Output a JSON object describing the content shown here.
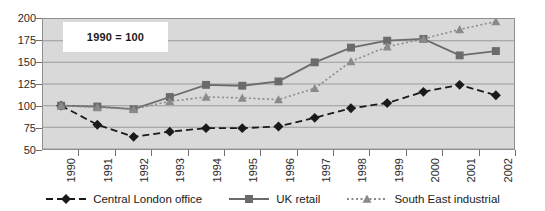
{
  "chart_data": {
    "type": "line",
    "title": "",
    "subtitle": "",
    "annotation": "1990 = 100",
    "xlabel": "",
    "ylabel": "",
    "categories": [
      "1990",
      "1991",
      "1992",
      "1993",
      "1994",
      "1995",
      "1996",
      "1997",
      "1998",
      "1999",
      "2000",
      "2001",
      "2002"
    ],
    "ylim": [
      50,
      200
    ],
    "ytick_step": 25,
    "yticks": [
      "200",
      "175",
      "150",
      "125",
      "100",
      "75",
      "50"
    ],
    "grid": true,
    "legend_position": "bottom",
    "series": [
      {
        "name": "Central London office",
        "marker": "diamond",
        "line_style": "dashed",
        "color": "#1a1a1a",
        "values": [
          100,
          78,
          64,
          70,
          74,
          74,
          76,
          86,
          97,
          103,
          116,
          124,
          112
        ]
      },
      {
        "name": "UK retail",
        "marker": "square",
        "line_style": "solid",
        "color": "#6b6b6b",
        "values": [
          100,
          99,
          96,
          110,
          124,
          123,
          128,
          150,
          167,
          175,
          177,
          158,
          163
        ]
      },
      {
        "name": "South East industrial",
        "marker": "triangle",
        "line_style": "dotted",
        "color": "#8a8a8a",
        "values": [
          100,
          98,
          96,
          105,
          110,
          109,
          107,
          120,
          151,
          168,
          177,
          188,
          197
        ]
      }
    ]
  },
  "colors": {
    "plot_background": "#d9d9d9",
    "gridline": "#9a9a9a",
    "axis": "#6e6e6e",
    "page_background": "#ffffff",
    "annotation_background": "#ffffff",
    "series_central_london_office": "#1a1a1a",
    "series_uk_retail": "#6b6b6b",
    "series_south_east_industrial": "#8a8a8a"
  }
}
